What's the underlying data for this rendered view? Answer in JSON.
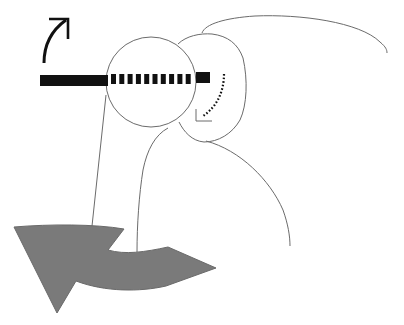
{
  "diagram": {
    "colors": {
      "background": "#ffffff",
      "line": "#6b6b6b",
      "rod": "#111111",
      "big_arrow_fill": "#7a7a7a"
    },
    "labels": []
  }
}
